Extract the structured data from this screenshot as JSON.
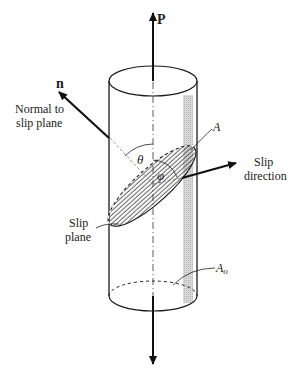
{
  "diagram": {
    "labels": {
      "force": "P",
      "normal_symbol": "n",
      "normal_caption_line1": "Normal to",
      "normal_caption_line2": "slip plane",
      "slip_direction_line1": "Slip",
      "slip_direction_line2": "direction",
      "slip_plane_line1": "Slip",
      "slip_plane_line2": "plane",
      "slip_area": "A",
      "cross_section_area": "A",
      "cross_section_subscript": "o",
      "theta": "θ",
      "phi": "φ"
    },
    "colors": {
      "stroke": "#1a1a1a",
      "shade": "#c8c8c8",
      "background": "#ffffff"
    }
  }
}
